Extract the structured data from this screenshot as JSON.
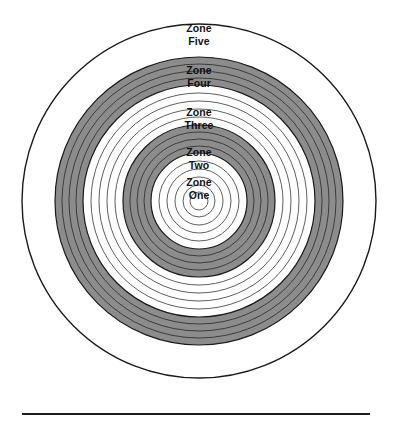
{
  "figure": {
    "name": "concentric-zones-target-diagram",
    "center": {
      "x": 199,
      "y": 201
    },
    "background_color": "#ffffff",
    "ring_stroke_color": "#1a1a1a",
    "shade_color": "#8c8c8c",
    "outer_stroke_width": 1.4,
    "thin_stroke_width": 0.7
  },
  "rings": [
    {
      "index": 1,
      "radius": 177,
      "fill": "#ffffff",
      "stroke_width": 1.4
    },
    {
      "index": 2,
      "radius": 144,
      "fill": "#8c8c8c",
      "stroke_width": 1.2
    },
    {
      "index": 3,
      "radius": 137,
      "fill": "#8c8c8c",
      "stroke_width": 0.7
    },
    {
      "index": 4,
      "radius": 130,
      "fill": "#8c8c8c",
      "stroke_width": 0.7
    },
    {
      "index": 5,
      "radius": 123,
      "fill": "#8c8c8c",
      "stroke_width": 0.7
    },
    {
      "index": 6,
      "radius": 116,
      "fill": "#ffffff",
      "stroke_width": 1.2
    },
    {
      "index": 7,
      "radius": 108,
      "fill": "#ffffff",
      "stroke_width": 0.7
    },
    {
      "index": 8,
      "radius": 100,
      "fill": "#ffffff",
      "stroke_width": 0.7
    },
    {
      "index": 9,
      "radius": 92,
      "fill": "#ffffff",
      "stroke_width": 0.7
    },
    {
      "index": 10,
      "radius": 84,
      "fill": "#ffffff",
      "stroke_width": 0.7
    },
    {
      "index": 11,
      "radius": 76,
      "fill": "#8c8c8c",
      "stroke_width": 1.2
    },
    {
      "index": 12,
      "radius": 69,
      "fill": "#8c8c8c",
      "stroke_width": 0.7
    },
    {
      "index": 13,
      "radius": 62,
      "fill": "#8c8c8c",
      "stroke_width": 0.7
    },
    {
      "index": 14,
      "radius": 55,
      "fill": "#8c8c8c",
      "stroke_width": 0.7
    },
    {
      "index": 15,
      "radius": 48,
      "fill": "#ffffff",
      "stroke_width": 1.2
    },
    {
      "index": 16,
      "radius": 40,
      "fill": "#ffffff",
      "stroke_width": 0.7
    },
    {
      "index": 17,
      "radius": 32,
      "fill": "#ffffff",
      "stroke_width": 0.7
    },
    {
      "index": 18,
      "radius": 24,
      "fill": "#ffffff",
      "stroke_width": 0.7
    },
    {
      "index": 19,
      "radius": 16,
      "fill": "#ffffff",
      "stroke_width": 0.7
    },
    {
      "index": 20,
      "radius": 9,
      "fill": "#ffffff",
      "stroke_width": 0.7
    }
  ],
  "labels": [
    {
      "id": "zone-five",
      "line1": "Zone",
      "line2": "Five",
      "text": "Zone\nFive",
      "x": 199,
      "y": 22,
      "band": "outer-white"
    },
    {
      "id": "zone-four",
      "line1": "Zone",
      "line2": "Four",
      "text": "Zone\nFour",
      "x": 199,
      "y": 64,
      "band": "gray"
    },
    {
      "id": "zone-three",
      "line1": "Zone",
      "line2": "Three",
      "text": "Zone\nThree",
      "x": 199,
      "y": 106,
      "band": "white"
    },
    {
      "id": "zone-two",
      "line1": "Zone",
      "line2": "Two",
      "text": "Zone\nTwo",
      "x": 199,
      "y": 146,
      "band": "gray"
    },
    {
      "id": "zone-one",
      "line1": "Zone",
      "line2": "One",
      "text": "Zone\nOne",
      "x": 199,
      "y": 176,
      "band": "center-white"
    }
  ],
  "bottom_rule": {
    "visible": true,
    "color": "#1a1a1a",
    "x": 22,
    "y": 413,
    "width": 348,
    "height": 2
  },
  "chart_data": {
    "type": "pie",
    "title": "",
    "categories": [
      "Zone One",
      "Zone Two",
      "Zone Three",
      "Zone Four",
      "Zone Five"
    ],
    "values": [
      48,
      76,
      116,
      144,
      177
    ],
    "ylabel": "Radius (px)",
    "xlabel": "Zone",
    "legend": "none",
    "grid": false
  }
}
